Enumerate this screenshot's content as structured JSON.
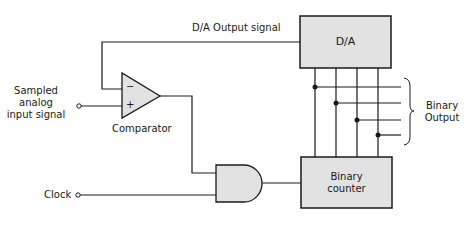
{
  "diagram": {
    "blocks": {
      "da": "D/A",
      "counter_line1": "Binary",
      "counter_line2": "counter",
      "comparator": "Comparator",
      "comparator_minus": "−",
      "comparator_plus": "+"
    },
    "signals": {
      "feedback": "D/A  Output  signal",
      "input_line1": "Sampled",
      "input_line2": "analog",
      "input_line3": "input signal",
      "clock": "Clock",
      "output_line1": "Binary",
      "output_line2": "Output"
    },
    "colors": {
      "block_fill": "#e2e2e2",
      "stroke": "#1a1a1a"
    }
  }
}
